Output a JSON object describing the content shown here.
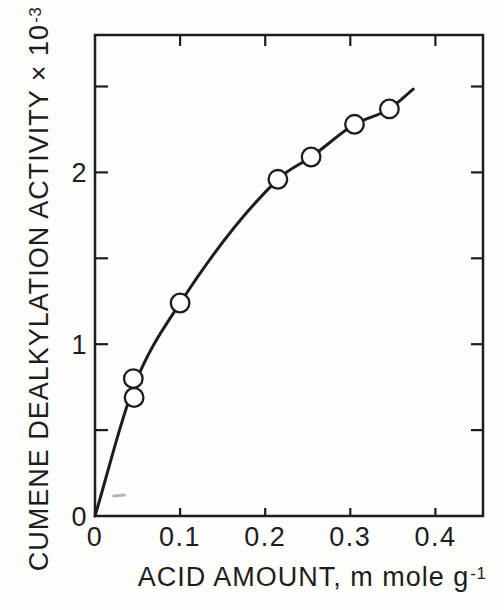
{
  "chart_data": {
    "type": "scatter",
    "title": "",
    "xlabel": {
      "text": "ACID AMOUNT, m mole g",
      "sup": "-1"
    },
    "ylabel": {
      "text": "CUMENE DEALKYLATION ACTIVITY × 10",
      "sup": "-3"
    },
    "xlim": [
      0,
      0.456
    ],
    "ylim": [
      0,
      2.8
    ],
    "x_ticks": {
      "values": [
        0,
        0.1,
        0.2,
        0.3,
        0.4
      ],
      "labels": [
        "0",
        "0.1",
        "0.2",
        "0.3",
        "0.4"
      ]
    },
    "y_ticks": {
      "values": [
        0,
        1,
        2
      ],
      "labels": [
        "0",
        "1",
        "2"
      ]
    },
    "x_tick_marks": [
      0.1,
      0.2,
      0.3,
      0.4
    ],
    "y_tick_marks": [
      0.5,
      1.0,
      1.5,
      2.0,
      2.5
    ],
    "points": [
      {
        "x": 0.045,
        "y": 0.8
      },
      {
        "x": 0.046,
        "y": 0.69
      },
      {
        "x": 0.1,
        "y": 1.24
      },
      {
        "x": 0.215,
        "y": 1.96
      },
      {
        "x": 0.254,
        "y": 2.09
      },
      {
        "x": 0.305,
        "y": 2.28
      },
      {
        "x": 0.346,
        "y": 2.37
      }
    ],
    "curve": [
      [
        0,
        0
      ],
      [
        0.045,
        0.745
      ],
      [
        0.1,
        1.24
      ],
      [
        0.215,
        1.96
      ],
      [
        0.254,
        2.09
      ],
      [
        0.305,
        2.28
      ],
      [
        0.346,
        2.37
      ],
      [
        0.374,
        2.485
      ]
    ],
    "marker": "open-circle",
    "grid": false,
    "legend": "none",
    "frame": "closed box with inward tick marks on all four sides",
    "colors": {
      "ink": "#1d1d1d",
      "paper": "#fdfdfc"
    }
  }
}
